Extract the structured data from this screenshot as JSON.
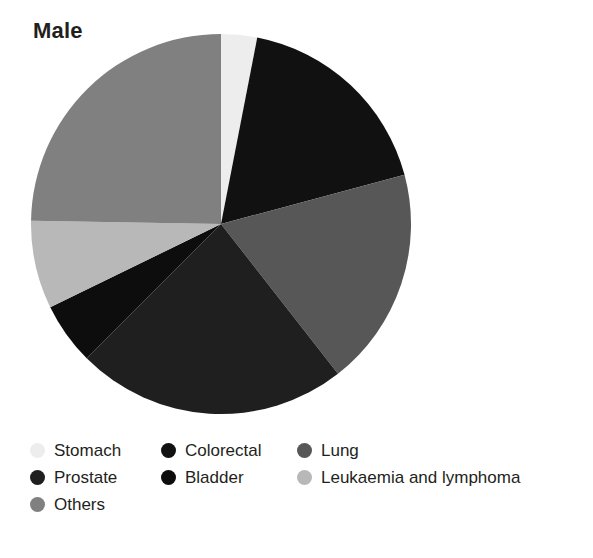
{
  "chart_data": {
    "type": "pie",
    "title": "Male",
    "xlabel": "",
    "ylabel": "",
    "legend_position": "bottom",
    "grid": false,
    "categories": [
      "Stomach",
      "Colorectal",
      "Lung",
      "Prostate",
      "Bladder",
      "Leukaemia and lymphoma",
      "Others"
    ],
    "values": [
      3,
      18,
      18.5,
      23,
      5,
      7.5,
      25
    ],
    "colors": [
      "#ededed",
      "#111111",
      "#575757",
      "#1f1f1f",
      "#0d0d0d",
      "#b8b8b8",
      "#808080"
    ],
    "slices": [
      {
        "label": "Stomach",
        "value": 3,
        "color": "#ededed",
        "start_angle": 0,
        "end_angle": 11
      },
      {
        "label": "Colorectal",
        "value": 18,
        "color": "#111111",
        "start_angle": 11,
        "end_angle": 75
      },
      {
        "label": "Lung",
        "value": 18.5,
        "color": "#575757",
        "start_angle": 75,
        "end_angle": 142
      },
      {
        "label": "Prostate",
        "value": 23,
        "color": "#1f1f1f",
        "start_angle": 142,
        "end_angle": 225
      },
      {
        "label": "Bladder",
        "value": 5,
        "color": "#0d0d0d",
        "start_angle": 225,
        "end_angle": 244
      },
      {
        "label": "Leukaemia and lymphoma",
        "value": 7.5,
        "color": "#b8b8b8",
        "start_angle": 244,
        "end_angle": 271
      },
      {
        "label": "Others",
        "value": 25,
        "color": "#808080",
        "start_angle": 271,
        "end_angle": 360
      }
    ]
  },
  "title": {
    "text": "Male"
  },
  "legend": {
    "rows": [
      [
        {
          "label": "Stomach",
          "color": "#ededed"
        },
        {
          "label": "Colorectal",
          "color": "#111111"
        },
        {
          "label": "Lung",
          "color": "#575757"
        }
      ],
      [
        {
          "label": "Prostate",
          "color": "#1f1f1f"
        },
        {
          "label": "Bladder",
          "color": "#0d0d0d"
        },
        {
          "label": "Leukaemia and lymphoma",
          "color": "#b8b8b8"
        }
      ],
      [
        {
          "label": "Others",
          "color": "#808080"
        }
      ]
    ]
  }
}
